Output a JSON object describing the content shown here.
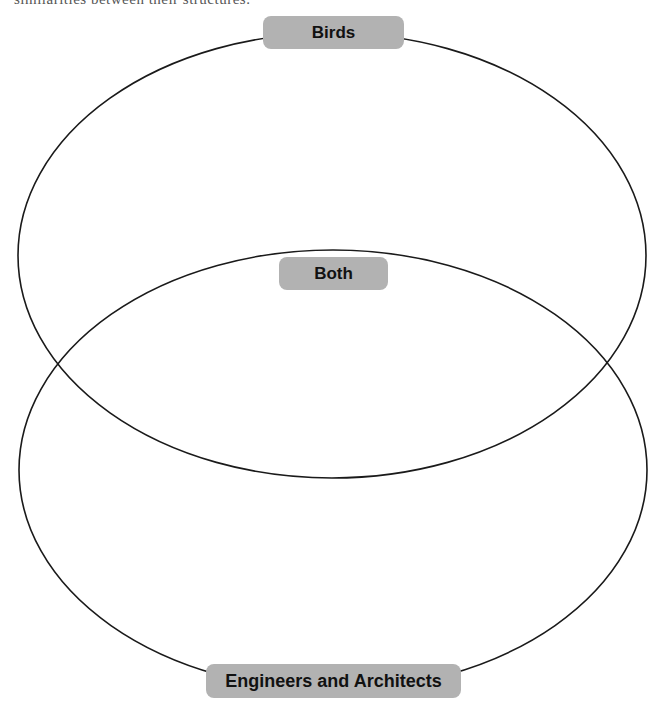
{
  "header": {
    "cutoff_text": "similarities between their structures."
  },
  "diagram": {
    "type": "venn",
    "sets": [
      {
        "id": "top",
        "label": "Birds"
      },
      {
        "id": "bottom",
        "label": "Engineers and Architects"
      }
    ],
    "intersection": {
      "label": "Both"
    },
    "colors": {
      "outline": "#1a1a1a",
      "label_background": "#b2b2b2",
      "label_text": "#111111"
    }
  }
}
